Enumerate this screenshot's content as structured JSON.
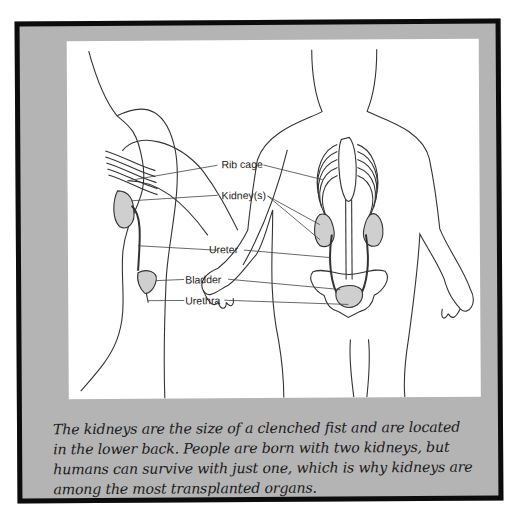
{
  "figure": {
    "labels": {
      "rib_cage": "Rib cage",
      "kidneys": "Kidney(s)",
      "ureter": "Ureter",
      "bladder": "Bladder",
      "urethra": "Urethra"
    },
    "caption": "The kidneys are the size of a clenched fist and are located in the lower back. People are born with two kidneys, but humans can survive with just one, which is why kidneys are among the most transplanted organs."
  },
  "colors": {
    "frame_border": "#0c0c0c",
    "frame_fill": "#b4b4b4",
    "panel": "#ffffff",
    "organ_fill": "#c8c8c8",
    "line": "#333333"
  }
}
